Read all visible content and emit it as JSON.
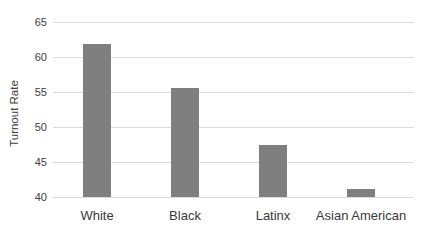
{
  "chart_data": {
    "type": "bar",
    "title": "",
    "categories": [
      "White",
      "Black",
      "Latinx",
      "Asian American"
    ],
    "values": [
      61.8,
      55.6,
      47.4,
      41.2
    ],
    "xlabel": "",
    "ylabel": "Turnout Rate",
    "ylim": [
      40,
      65
    ],
    "yticks": [
      65,
      60,
      55,
      50,
      45,
      40
    ],
    "grid": true,
    "legend": "none",
    "colors": {
      "bar": "#7f7f7f",
      "gridline": "#dcdcdc",
      "tick_text": "#404040",
      "category_text": "#3a3a3a",
      "axis_title_text": "#404040",
      "background": "#ffffff"
    }
  }
}
